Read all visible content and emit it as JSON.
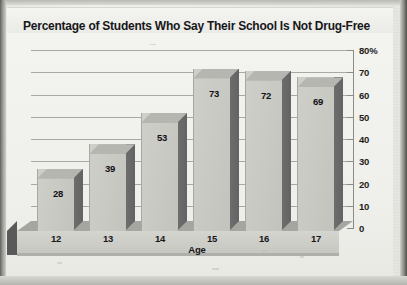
{
  "chart_data": {
    "type": "bar",
    "title": "Percentage of Students Who Say Their School Is Not Drug-Free",
    "xlabel": "Age",
    "ylabel": "",
    "categories": [
      "12",
      "13",
      "14",
      "15",
      "16",
      "17"
    ],
    "values": [
      28,
      39,
      53,
      73,
      72,
      69
    ],
    "value_labels": [
      "28",
      "39",
      "53",
      "73",
      "72",
      "69"
    ],
    "ylim": [
      0,
      80
    ],
    "ytick_values": [
      0,
      10,
      20,
      30,
      40,
      50,
      60,
      70,
      80
    ],
    "ytick_labels": [
      "0",
      "10",
      "20",
      "30",
      "40",
      "50",
      "60",
      "70",
      "80%"
    ],
    "grid": true,
    "legend": false,
    "style": "3d-bar",
    "axis_position": "right",
    "colors": {
      "bar_face": "#c9c9c4",
      "bar_side": "#68686a",
      "bar_top": "#b6b6b1",
      "grid_line": "#a9a9a4",
      "plot_background": "#f1f1ed",
      "text": "#17171a"
    }
  }
}
